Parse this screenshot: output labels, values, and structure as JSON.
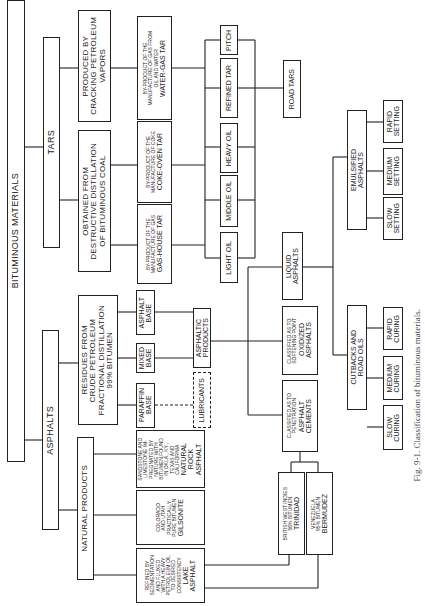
{
  "title": "BITUMINOUS MATERIALS",
  "branches": {
    "tars": {
      "label": "TARS",
      "sources": [
        {
          "label": "PRODUCED BY\nCRACKING PETROLEUM\nVAPORS"
        },
        {
          "label": "OBTAINED FROM\nDESTRUCTIVE DISTILLATION\nOF BITUMINOUS COAL"
        }
      ],
      "tar_types": [
        {
          "name": "WATER-GAS TAR",
          "desc": "BY-PRODUCT OF THE\nMANUFACTURE OF GAS FROM\nOIL AND WATER"
        },
        {
          "name": "COKE-OVEN TAR",
          "desc": "BY-PRODUCT OF THE\nMANUFACTURE OF COKE"
        },
        {
          "name": "GAS-HOUSE TAR",
          "desc": "BY-PRODUCT OF THE\nMANUFACTURE OF GAS"
        }
      ],
      "fractions": [
        "PITCH",
        "REFINED TAR",
        "HEAVY OIL",
        "MIDDLE OIL",
        "LIGHT OIL"
      ],
      "product": "ROAD TARS"
    },
    "asphalts": {
      "label": "ASPHALTS",
      "residues": {
        "label": "RESIDUES FROM\nCRUDE PETROLEUM\nFRACTIONAL DISTILLATION\n99% BITUMEN"
      },
      "bases": [
        "ASPHALT\nBASE",
        "MIXED\nBASE",
        "PARAFFIN\nBASE"
      ],
      "lubricants": "LUBRICANTS",
      "asphaltic_products": "ASPHALTIC\nPRODUCTS",
      "natural_products": {
        "label": "NATURAL PRODUCTS",
        "items": [
          {
            "name": "NATURAL\nROCK\nASPHALT",
            "desc": "SANDSTONE AND\nLIMESTONE IM-\nPREGNATED BY\nNATURE WITH\nBITUMEN,FOUND\nIN OKLA., KY.,\nTEXAS AND\nCALIFORNIA"
          },
          {
            "name": "GILSONITE",
            "desc": "COLORADO\nAND UTAH\nPRACTICALLY\nPURE BITUMEN"
          },
          {
            "name": "LAKE\nASPHALT",
            "desc": "REFINED BY\nSEDIMENTATION\nAND FLUXED\nWITH A HEAVY\nPETROLEUM OIL\nTO DESIRED\nCONSISTENCY"
          }
        ]
      },
      "lake_sources": [
        {
          "name": "TRINIDAD",
          "desc": "BRITISH WEST INDIES\n56% BITUMEN"
        },
        {
          "name": "BERMUDEZ",
          "desc": "VENEZUELA\n95% BITUMEN"
        }
      ],
      "categories": [
        {
          "name": "LIQUID\nASPHALTS",
          "desc": ""
        },
        {
          "name": "OXIDIZED\nASPHALTS",
          "desc": "CLASSIFIED AS TO\nSOFTENING POINT"
        },
        {
          "name": "ASPHALT\nCEMENTS",
          "desc": "CLASSIFIED AS TO\nPENETRATION"
        }
      ],
      "liquid_types": {
        "emulsified": {
          "label": "EMULSIFIED\nASPHALTS",
          "grades": [
            "RAPID\nSETTING",
            "MEDIUM\nSETTING",
            "SLOW\nSETTING"
          ]
        },
        "cutbacks": {
          "label": "CUTBACKS AND\nROAD OILS",
          "grades": [
            "RAPID\nCURING",
            "MEDIUM\nCURING",
            "SLOW\nCURING"
          ]
        }
      }
    }
  },
  "caption": "Fig. 9-1. Classification of bituminous materials."
}
